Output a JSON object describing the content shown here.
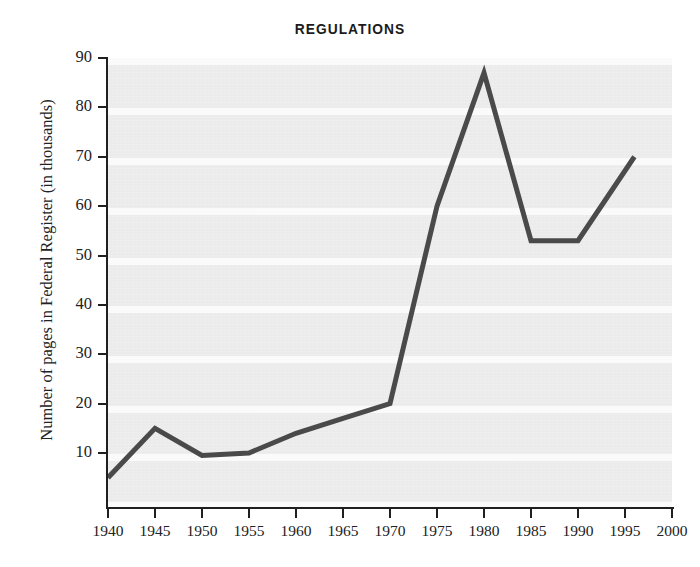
{
  "chart_data": {
    "type": "line",
    "title": "REGULATIONS",
    "xlabel": "",
    "ylabel": "Number of pages in Federal Register (in thousands)",
    "xlim": [
      1940,
      2000
    ],
    "ylim": [
      0,
      90
    ],
    "xticks": [
      1940,
      1945,
      1950,
      1955,
      1960,
      1965,
      1970,
      1975,
      1980,
      1985,
      1990,
      1995,
      2000
    ],
    "yticks": [
      10,
      20,
      30,
      40,
      50,
      60,
      70,
      80,
      90
    ],
    "grid": false,
    "legend": null,
    "line_color": "#4a4a4a",
    "plot_background": "#ebebeb",
    "series": [
      {
        "name": "Pages in Federal Register",
        "x": [
          1940,
          1945,
          1950,
          1955,
          1960,
          1965,
          1970,
          1975,
          1980,
          1985,
          1990,
          1996
        ],
        "values": [
          5,
          15,
          9.5,
          10,
          14,
          17,
          20,
          60,
          87,
          53,
          53,
          70
        ]
      }
    ]
  },
  "axis": {
    "y_tick_labels": [
      "90",
      "80",
      "70",
      "60",
      "50",
      "40",
      "30",
      "20",
      "10"
    ],
    "x_tick_labels": [
      "1940",
      "1945",
      "1950",
      "1955",
      "1960",
      "1965",
      "1970",
      "1975",
      "1980",
      "1985",
      "1990",
      "1995",
      "2000"
    ]
  }
}
